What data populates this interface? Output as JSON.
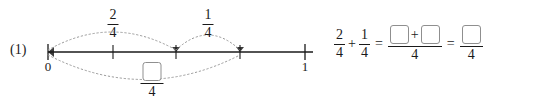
{
  "problem": {
    "number_label": "(1)"
  },
  "numberline": {
    "start_label": "0",
    "end_label": "1",
    "tick_positions": [
      48,
      113,
      176,
      240,
      305
    ],
    "line_start_x": 48,
    "line_end_x": 313,
    "axis_y": 52,
    "arcs": [
      {
        "name": "arc-two-fourths",
        "from_x": 48,
        "to_x": 176,
        "direction": "above",
        "numerator": "2",
        "denominator": "4"
      },
      {
        "name": "arc-one-fourth",
        "from_x": 176,
        "to_x": 240,
        "direction": "above",
        "numerator": "1",
        "denominator": "4"
      },
      {
        "name": "arc-sum",
        "from_x": 48,
        "to_x": 240,
        "direction": "below",
        "numerator": "",
        "denominator": "4"
      }
    ]
  },
  "equation": {
    "term1": {
      "numerator": "2",
      "denominator": "4"
    },
    "plus": "+",
    "term2": {
      "numerator": "1",
      "denominator": "4"
    },
    "equals1": "=",
    "term3": {
      "numerator_plus": "+",
      "denominator": "4",
      "box1": "",
      "box2": ""
    },
    "equals2": "=",
    "term4": {
      "denominator": "4",
      "box": ""
    }
  },
  "colors": {
    "ink": "#1a1a1a",
    "arc": "#9a9a9a",
    "box_border": "#8f8f8f",
    "background": "#ffffff"
  }
}
